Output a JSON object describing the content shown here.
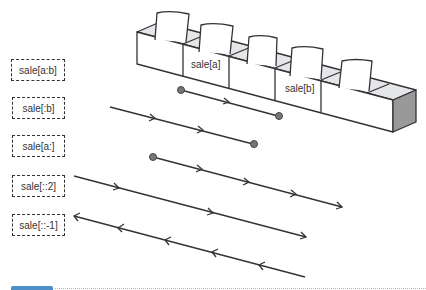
{
  "diagram": {
    "title_labels": [
      {
        "id": "slice-a-b",
        "text": "sale[a:b]"
      },
      {
        "id": "slice-to-b",
        "text": "sale[:b]"
      },
      {
        "id": "slice-from-a",
        "text": "sale[a:]"
      },
      {
        "id": "slice-step-2",
        "text": "sale[::2]"
      },
      {
        "id": "slice-reverse",
        "text": "sale[::-1]"
      }
    ],
    "boxes": {
      "count": 5,
      "marked": [
        {
          "index": 1,
          "text": "sale[a]"
        },
        {
          "index": 3,
          "text": "sale[b]"
        }
      ]
    },
    "arrows": [
      {
        "label": "sale[a:b]",
        "direction": "forward",
        "start_marker": "dot",
        "end_marker": "dot"
      },
      {
        "label": "sale[:b]",
        "direction": "forward",
        "start_marker": "none",
        "end_marker": "dot"
      },
      {
        "label": "sale[a:]",
        "direction": "forward",
        "start_marker": "dot",
        "end_marker": "arrow"
      },
      {
        "label": "sale[::2]",
        "direction": "forward",
        "start_marker": "none",
        "end_marker": "arrow"
      },
      {
        "label": "sale[::-1]",
        "direction": "backward",
        "start_marker": "arrow",
        "end_marker": "none"
      }
    ],
    "colors": {
      "line": "#333333",
      "dot": "#777777",
      "box_side_dark": "#999999",
      "box_inside": "#e4e6ea",
      "footer_tab": "#4a8fc8"
    }
  }
}
